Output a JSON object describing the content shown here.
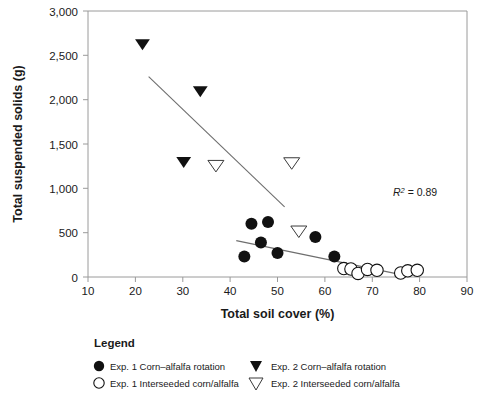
{
  "chart_data": {
    "type": "scatter",
    "title": "",
    "xlabel": "Total soil cover (%)",
    "ylabel": "Total suspended solids (g)",
    "xlim": [
      10,
      90
    ],
    "ylim": [
      0,
      3000
    ],
    "xticks": [
      10,
      20,
      30,
      40,
      50,
      60,
      70,
      80,
      90
    ],
    "yticks": [
      0,
      500,
      1000,
      1500,
      2000,
      2500,
      3000
    ],
    "xtick_labels": [
      "10",
      "20",
      "30",
      "40",
      "50",
      "60",
      "70",
      "80",
      "90"
    ],
    "ytick_labels": [
      "0",
      "500",
      "1,000",
      "1,500",
      "2,000",
      "2,500",
      "3,000"
    ],
    "grid": false,
    "legend_position": "below-plot",
    "annotations": [
      {
        "name": "r-squared",
        "text_prefix": "R",
        "text_superscript": "2",
        "text_suffix": " = 0.89",
        "x": 76.5,
        "y": 700
      }
    ],
    "series": [
      {
        "name": "Exp. 1 Corn–alfalfa rotation",
        "marker": "filled-circle",
        "points": [
          {
            "x": 43.0,
            "y": 230
          },
          {
            "x": 44.5,
            "y": 600
          },
          {
            "x": 46.5,
            "y": 390
          },
          {
            "x": 48.0,
            "y": 620
          },
          {
            "x": 50.0,
            "y": 270
          },
          {
            "x": 58.0,
            "y": 450
          },
          {
            "x": 62.0,
            "y": 230
          }
        ]
      },
      {
        "name": "Exp. 1 Interseeded corn/alfalfa",
        "marker": "open-circle",
        "points": [
          {
            "x": 64.0,
            "y": 95
          },
          {
            "x": 65.5,
            "y": 90
          },
          {
            "x": 67.0,
            "y": 40
          },
          {
            "x": 69.0,
            "y": 85
          },
          {
            "x": 71.0,
            "y": 75
          },
          {
            "x": 76.0,
            "y": 45
          },
          {
            "x": 77.5,
            "y": 70
          },
          {
            "x": 79.5,
            "y": 75
          }
        ]
      },
      {
        "name": "Exp. 2 Corn–alfalfa rotation",
        "marker": "filled-triangle-down",
        "points": [
          {
            "x": 21.5,
            "y": 2620
          },
          {
            "x": 33.7,
            "y": 2090
          },
          {
            "x": 30.2,
            "y": 1290
          }
        ]
      },
      {
        "name": "Exp. 2 Interseeded corn/alfalfa",
        "marker": "open-triangle-down",
        "points": [
          {
            "x": 37.0,
            "y": 1250
          },
          {
            "x": 53.0,
            "y": 1280
          },
          {
            "x": 54.5,
            "y": 510
          }
        ]
      }
    ],
    "trend_lines": [
      {
        "name": "exp2-trend",
        "x0": 22.8,
        "y0": 2260,
        "x1": 51.5,
        "y1": 790
      },
      {
        "name": "exp1-trend",
        "x0": 41.3,
        "y0": 410,
        "x1": 75.8,
        "y1": 30
      }
    ]
  },
  "legend": {
    "title": "Legend",
    "entries": [
      {
        "marker": "filled-circle",
        "label": "Exp. 1 Corn–alfalfa rotation"
      },
      {
        "marker": "filled-triangle-down",
        "label": "Exp. 2 Corn–alfalfa rotation"
      },
      {
        "marker": "open-circle",
        "label": "Exp. 1 Interseeded corn/alfalfa"
      },
      {
        "marker": "open-triangle-down",
        "label": "Exp. 2 Interseeded corn/alfalfa"
      }
    ]
  },
  "colors": {
    "marker_fill": "#111111",
    "marker_stroke": "#111111",
    "axis": "#9a9a9a",
    "trend": "#6e6e6e",
    "text": "#1a1a1a",
    "background": "#ffffff"
  }
}
